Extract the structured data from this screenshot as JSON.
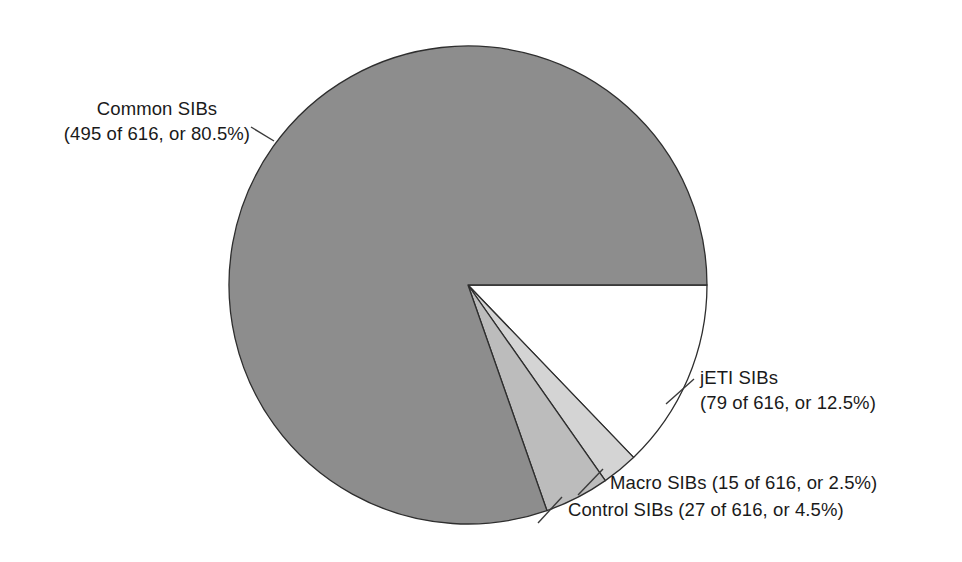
{
  "figure": {
    "background_color": "#ffffff",
    "text_color": "#1a1a1a"
  },
  "chart_data": {
    "type": "pie",
    "title": "",
    "total": 616,
    "unit": "SIBs",
    "legend_position": "callout-labels",
    "start_angle_deg": 0,
    "direction": "clockwise",
    "categories": [
      "jETI SIBs",
      "Macro SIBs",
      "Control SIBs",
      "Common SIBs"
    ],
    "values": [
      79,
      15,
      27,
      495
    ],
    "percentages": [
      12.5,
      2.5,
      4.5,
      80.5
    ],
    "colors": [
      "#ffffff",
      "#d4d4d4",
      "#bcbcbc",
      "#8d8d8d"
    ],
    "slices": [
      {
        "name": "jETI SIBs",
        "label_line1": "jETI SIBs",
        "label_line2": "(79 of 616, or 12.5%)",
        "value": 79,
        "total": 616,
        "percent": 12.5,
        "color": "#ffffff"
      },
      {
        "name": "Macro SIBs",
        "label_line1": "Macro SIBs (15 of 616, or 2.5%)",
        "label_line2": "",
        "value": 15,
        "total": 616,
        "percent": 2.5,
        "color": "#d4d4d4"
      },
      {
        "name": "Control SIBs",
        "label_line1": "Control SIBs (27 of 616, or 4.5%)",
        "label_line2": "",
        "value": 27,
        "total": 616,
        "percent": 4.5,
        "color": "#bcbcbc"
      },
      {
        "name": "Common SIBs",
        "label_line1": "Common SIBs",
        "label_line2": "(495 of 616, or 80.5%)",
        "value": 495,
        "total": 616,
        "percent": 80.5,
        "color": "#8d8d8d"
      }
    ]
  },
  "labels": {
    "common_line1": "Common SIBs",
    "common_line2": "(495 of 616, or 80.5%)",
    "jeti_line1": "jETI SIBs",
    "jeti_line2": "(79 of 616, or 12.5%)",
    "macro": "Macro SIBs (15 of 616, or 2.5%)",
    "control": "Control SIBs (27 of 616, or 4.5%)"
  }
}
